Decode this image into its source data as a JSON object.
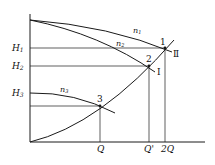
{
  "diagram": {
    "type": "pump characteristic curves with system curve",
    "y_labels": {
      "H1": "H",
      "H1_sub": "1",
      "H2": "H",
      "H2_sub": "2",
      "H3": "H",
      "H3_sub": "3"
    },
    "x_labels": {
      "Q": "Q",
      "Qprime": "Q'",
      "twoQ": "2Q"
    },
    "curve_labels": {
      "n1": "n",
      "n1_sub": "1",
      "n2": "n",
      "n2_sub": "2",
      "n3": "n",
      "n3_sub": "3"
    },
    "point_labels": {
      "p1": "1",
      "p2": "2",
      "p3": "3"
    },
    "system_curve_labels": {
      "I": "Ⅰ",
      "II": "Ⅱ"
    },
    "colors": {
      "line": "#1a1a1a",
      "background": "#ffffff"
    }
  }
}
